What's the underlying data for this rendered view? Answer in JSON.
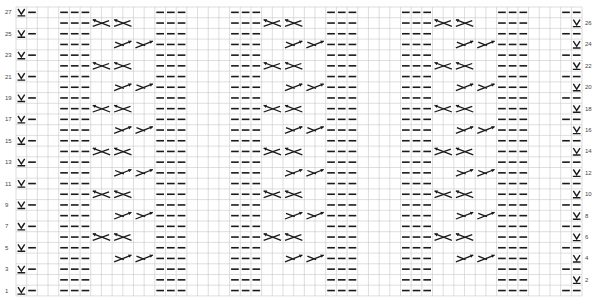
{
  "chart_data": {
    "type": "knitting-chart",
    "title": "",
    "rows": 27,
    "columns": 53,
    "grid": {
      "left": 16,
      "top": 7,
      "cell_w": 10.68,
      "cell_h": 10.7,
      "line_color": "#c8c8c8",
      "ink_color": "#1a1a1a"
    },
    "left_row_labels": [
      "27",
      "25",
      "23",
      "21",
      "19",
      "17",
      "15",
      "13",
      "11",
      "9",
      "7",
      "5",
      "3",
      "1"
    ],
    "right_row_labels": [
      "26",
      "24",
      "22",
      "20",
      "18",
      "16",
      "14",
      "12",
      "10",
      "8",
      "6",
      "4",
      "2"
    ],
    "symbols_legend": {
      "purl": "horizontal dash",
      "slip": "V with underline",
      "cable_left": "left-leaning cross with arrow up-left",
      "cable_right": "right-leaning cross with arrow up-right"
    },
    "purl_columns_all_rows": [
      4,
      5,
      6,
      13,
      14,
      15,
      20,
      21,
      22,
      29,
      30,
      31,
      36,
      37,
      38,
      45,
      46,
      47
    ],
    "odd_rows": {
      "slip_columns": [
        0
      ],
      "extra_purl_columns": [
        1,
        51,
        52
      ]
    },
    "even_rows": {
      "slip_columns": [
        52
      ]
    },
    "cable_left_rows": [
      26,
      22,
      18,
      14,
      10,
      6
    ],
    "cable_right_rows": [
      24,
      20,
      16,
      12,
      8,
      4
    ],
    "cable_left_start_columns": [
      7,
      9,
      23,
      25,
      39,
      41
    ],
    "cable_right_start_columns": [
      9,
      11,
      25,
      27,
      41,
      43
    ],
    "cable_span": 2
  }
}
